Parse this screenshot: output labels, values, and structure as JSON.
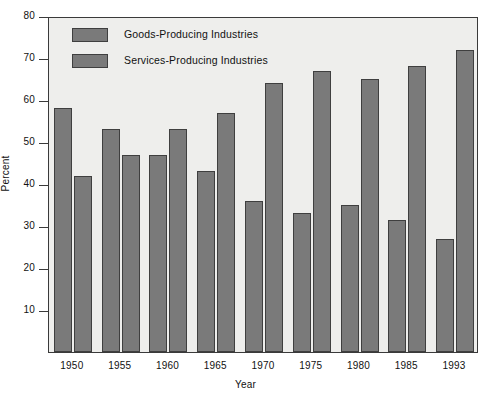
{
  "chart_data": {
    "type": "bar",
    "title": "",
    "xlabel": "Year",
    "ylabel": "Percent",
    "categories": [
      "1950",
      "1955",
      "1960",
      "1965",
      "1970",
      "1975",
      "1980",
      "1985",
      "1993"
    ],
    "series": [
      {
        "name": "Goods-Producing Industries",
        "values": [
          58,
          53,
          47,
          43,
          36,
          33,
          35,
          31.5,
          27
        ]
      },
      {
        "name": "Services-Producing Industries",
        "values": [
          42,
          47,
          53,
          57,
          64,
          67,
          65,
          68,
          72
        ]
      }
    ],
    "ylim": [
      0,
      80
    ],
    "yticks": [
      10,
      20,
      30,
      40,
      50,
      60,
      70,
      80
    ],
    "ytick_labels": [
      "10",
      "20",
      "30",
      "40",
      "50",
      "60",
      "70",
      "80"
    ],
    "grid": false,
    "legend_position": "top-left",
    "bar_color": "#7a7a7a",
    "bar_edge_color": "#3f3f3f",
    "plot_background": "#eeeeec",
    "axis_color": "#3a3a3a"
  },
  "legend": {
    "entries": [
      {
        "label": "Goods-Producing Industries",
        "swatch": "legend-swatch-goods"
      },
      {
        "label": "Services-Producing Industries",
        "swatch": "legend-swatch-services"
      }
    ]
  }
}
